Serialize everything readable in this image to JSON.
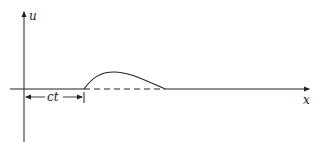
{
  "diagram": {
    "axes": {
      "vertical_label": "u",
      "horizontal_label": "x"
    },
    "annotation": {
      "label": "ct"
    },
    "elements": {
      "pulse": "wave-pulse-curve",
      "baseline_under_pulse": "dashed"
    },
    "colors": {
      "line": "#222222",
      "background": "#ffffff"
    }
  }
}
